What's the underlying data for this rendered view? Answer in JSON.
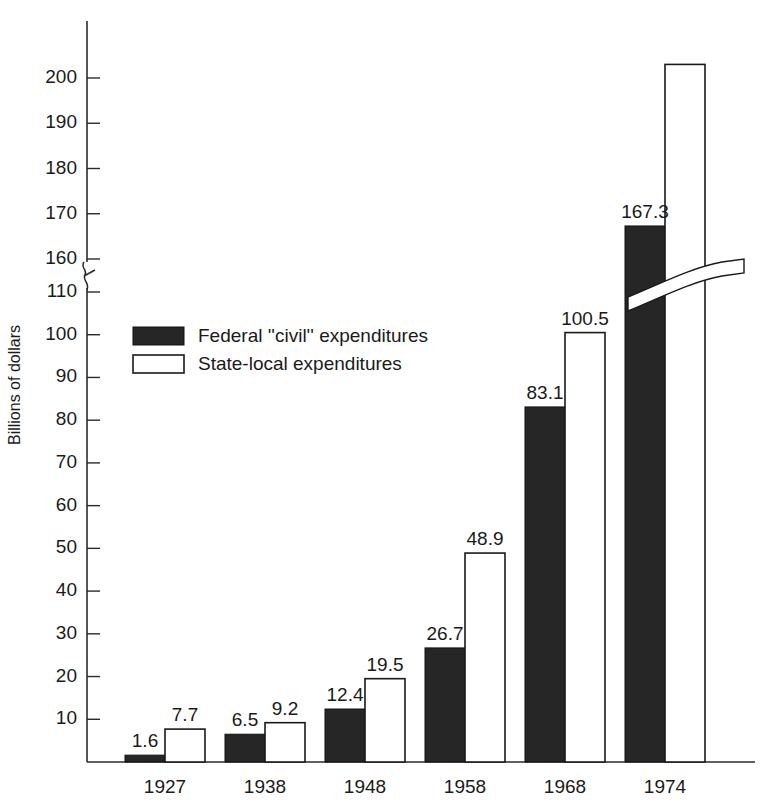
{
  "chart_data": {
    "type": "bar",
    "title": "",
    "xlabel": "",
    "ylabel": "Billions of dollars",
    "categories": [
      "1927",
      "1938",
      "1948",
      "1958",
      "1968",
      "1974"
    ],
    "series": [
      {
        "name": "Federal ''civil'' expenditures",
        "color": "#262626",
        "values": [
          1.6,
          6.5,
          12.4,
          26.7,
          83.1,
          167.3
        ],
        "labels": [
          "1.6",
          "6.5",
          "12.4",
          "26.7",
          "83.1",
          "167.3"
        ]
      },
      {
        "name": "State-local expenditures",
        "color": "#ffffff",
        "values": [
          7.7,
          9.2,
          19.5,
          48.9,
          100.5,
          203.0
        ],
        "labels": [
          "7.7",
          "9.2",
          "19.5",
          "48.9",
          "100.5",
          ""
        ]
      }
    ],
    "ytick_labels": [
      "10",
      "20",
      "30",
      "40",
      "50",
      "60",
      "70",
      "80",
      "90",
      "100",
      "110",
      "160",
      "170",
      "180",
      "190",
      "200"
    ],
    "ytick_values": [
      10,
      20,
      30,
      40,
      50,
      60,
      70,
      80,
      90,
      100,
      110,
      160,
      170,
      180,
      190,
      200
    ],
    "ylim": [
      0,
      207
    ],
    "axis_break": {
      "present": true,
      "below": 110,
      "above": 160,
      "note": "y-axis broken between 110 and 160"
    },
    "grid": false,
    "legend_position": "upper-left-inside",
    "axis_color": "#2b2b2b"
  },
  "legend": {
    "entries": [
      {
        "label": "Federal ''civil'' expenditures",
        "swatch": "filled-black"
      },
      {
        "label": "State-local expenditures",
        "swatch": "outlined-white"
      }
    ]
  }
}
